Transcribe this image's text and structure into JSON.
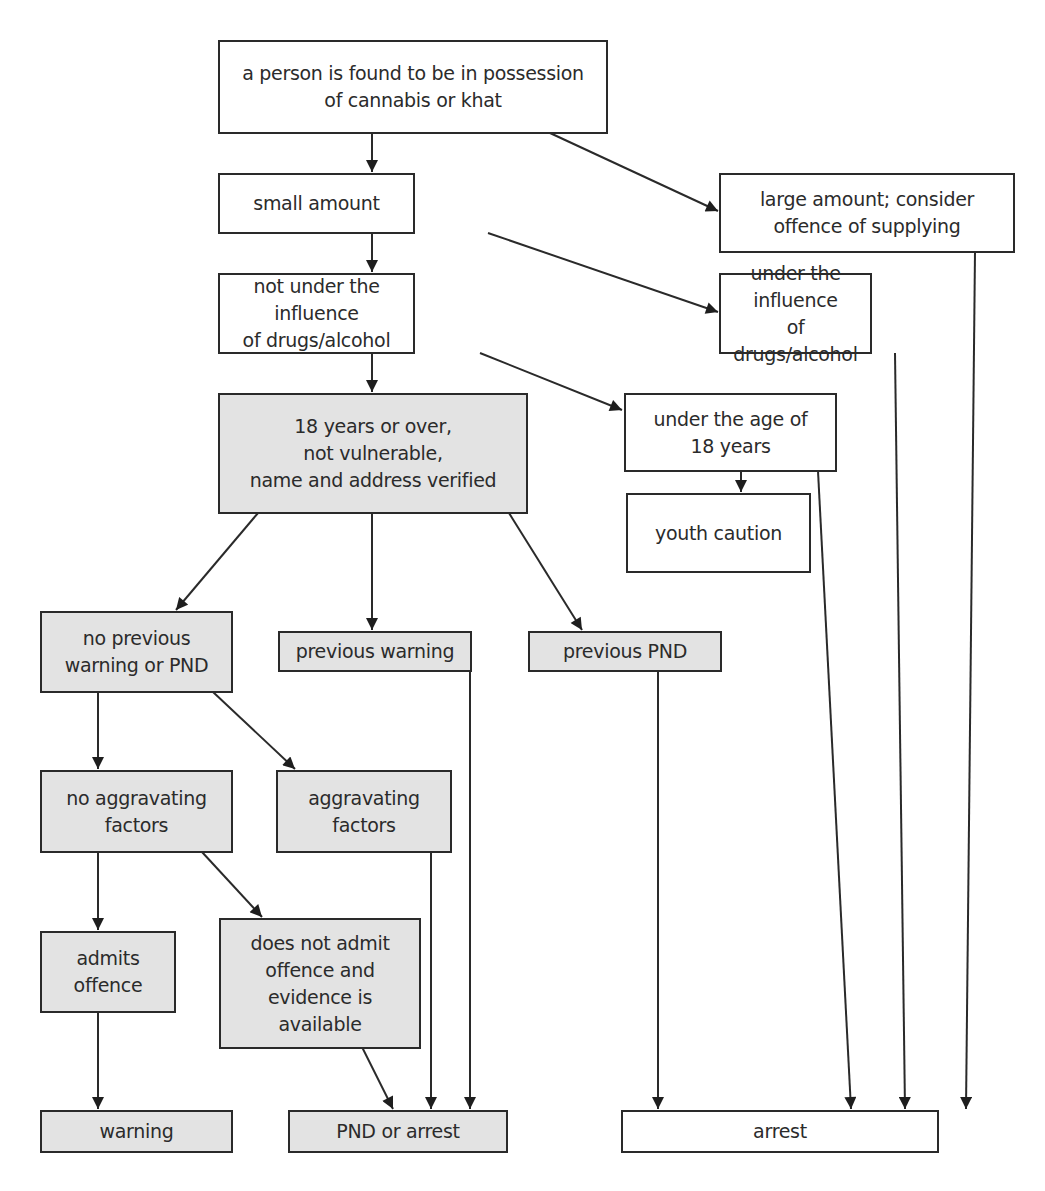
{
  "diagram": {
    "type": "flowchart",
    "colors": {
      "line": "#2a2a2a",
      "box_white": "#ffffff",
      "box_gray": "#e3e3e3",
      "text": "#2b2b2b"
    },
    "nodes": {
      "possession": {
        "label": "a person is found to be in possession\nof cannabis or khat",
        "fill": "white"
      },
      "small": {
        "label": "small amount",
        "fill": "white"
      },
      "large": {
        "label": "large amount; consider\noffence of supplying",
        "fill": "white"
      },
      "not_under": {
        "label": "not under the influence\nof drugs/alcohol",
        "fill": "white"
      },
      "under": {
        "label": "under the influence\nof drugs/alcohol",
        "fill": "white"
      },
      "adult": {
        "label": "18 years or over,\nnot vulnerable,\nname and address verified",
        "fill": "gray"
      },
      "under18": {
        "label": "under the age of\n18 years",
        "fill": "white"
      },
      "youth": {
        "label": "youth caution",
        "fill": "white"
      },
      "no_prev": {
        "label": "no previous\nwarning or PND",
        "fill": "gray"
      },
      "prev_warning": {
        "label": "previous warning",
        "fill": "gray"
      },
      "prev_pnd": {
        "label": "previous PND",
        "fill": "gray"
      },
      "no_aggr": {
        "label": "no aggravating\nfactors",
        "fill": "gray"
      },
      "aggr": {
        "label": "aggravating\nfactors",
        "fill": "gray"
      },
      "admits": {
        "label": "admits\noffence",
        "fill": "gray"
      },
      "not_admit": {
        "label": "does not admit\noffence and\nevidence is\navailable",
        "fill": "gray"
      },
      "warning": {
        "label": "warning",
        "fill": "gray"
      },
      "pnd_arrest": {
        "label": "PND or arrest",
        "fill": "gray"
      },
      "arrest": {
        "label": "arrest",
        "fill": "white"
      }
    },
    "edges": [
      [
        "possession",
        "small"
      ],
      [
        "possession",
        "large"
      ],
      [
        "small",
        "not_under"
      ],
      [
        "small",
        "under"
      ],
      [
        "not_under",
        "adult"
      ],
      [
        "not_under",
        "under18"
      ],
      [
        "under18",
        "youth"
      ],
      [
        "adult",
        "no_prev"
      ],
      [
        "adult",
        "prev_warning"
      ],
      [
        "adult",
        "prev_pnd"
      ],
      [
        "no_prev",
        "no_aggr"
      ],
      [
        "no_prev",
        "aggr"
      ],
      [
        "no_aggr",
        "admits"
      ],
      [
        "no_aggr",
        "not_admit"
      ],
      [
        "admits",
        "warning"
      ],
      [
        "not_admit",
        "pnd_arrest"
      ],
      [
        "aggr",
        "pnd_arrest"
      ],
      [
        "prev_warning",
        "pnd_arrest"
      ],
      [
        "prev_pnd",
        "arrest"
      ],
      [
        "under18",
        "arrest"
      ],
      [
        "under",
        "arrest"
      ],
      [
        "large",
        "arrest"
      ]
    ]
  }
}
